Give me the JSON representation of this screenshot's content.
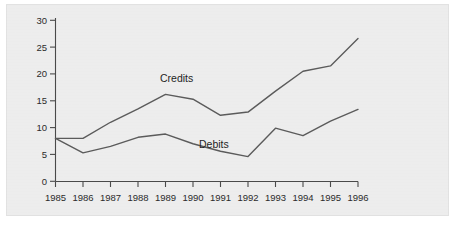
{
  "chart_data": {
    "type": "line",
    "title": "",
    "subtitle": "",
    "xlabel": "",
    "ylabel": "",
    "categories": [
      "1985",
      "1986",
      "1987",
      "1988",
      "1989",
      "1990",
      "1991",
      "1992",
      "1993",
      "1994",
      "1995",
      "1996"
    ],
    "x": [
      1985,
      1986,
      1987,
      1988,
      1989,
      1990,
      1991,
      1992,
      1993,
      1994,
      1995,
      1996
    ],
    "series": [
      {
        "name": "Credits",
        "values": [
          8.0,
          8.0,
          11.0,
          13.5,
          16.2,
          15.3,
          12.3,
          12.9,
          16.8,
          20.5,
          21.5,
          26.6
        ]
      },
      {
        "name": "Debits",
        "values": [
          8.0,
          5.3,
          6.5,
          8.2,
          8.8,
          7.0,
          5.6,
          4.6,
          9.9,
          8.5,
          11.2,
          13.4
        ]
      }
    ],
    "xlim": [
      1985,
      1996
    ],
    "ylim": [
      0,
      30
    ],
    "y_ticks": [
      0,
      5,
      10,
      15,
      20,
      25,
      30
    ],
    "x_ticks": [
      "1985",
      "1986",
      "1987",
      "1988",
      "1989",
      "1990",
      "1991",
      "1992",
      "1993",
      "1994",
      "1995",
      "1996"
    ],
    "grid": false,
    "legend_position": "inline-annotation",
    "annotations": [
      {
        "label": "Credits",
        "near_x": 1989,
        "near_y": 19.5
      },
      {
        "label": "Debits",
        "near_x": 1991,
        "near_y": 7.5
      }
    ],
    "colors": {
      "background": "#ededed",
      "page": "#ffffff",
      "axis": "#4a4a4a",
      "credits_line": "#5b5b5b",
      "debits_line": "#5b5b5b",
      "text": "#2b2b2b",
      "border": "#e2e2e2"
    }
  },
  "axis": {
    "y_tick_labels": [
      "30",
      "25",
      "20",
      "15",
      "10",
      "5",
      "0"
    ],
    "x_tick_labels": [
      "1985",
      "1986",
      "1987",
      "1988",
      "1989",
      "1990",
      "1991",
      "1992",
      "1993",
      "1994",
      "1995",
      "1996"
    ]
  },
  "annotations": {
    "credits_label": "Credits",
    "debits_label": "Debits"
  }
}
